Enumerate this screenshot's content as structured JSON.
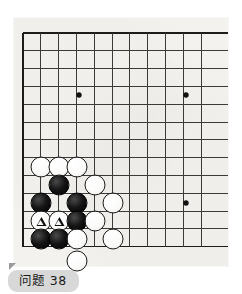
{
  "caption": {
    "label": "问题 38",
    "problem_number": "38"
  },
  "board": {
    "name": "go-board",
    "visible_columns": 11,
    "visible_rows": 13,
    "origin_x": 23,
    "origin_y": 33,
    "cell": 17.8,
    "paper_color": "#f3f2ee",
    "line_color": "#3c3a38",
    "edge_line_color": "#1e1c1a",
    "star_points": [
      {
        "x": 79,
        "y": 95
      },
      {
        "x": 186,
        "y": 95
      },
      {
        "x": 186,
        "y": 203
      }
    ],
    "stones": [
      {
        "color": "white",
        "x": 41,
        "y": 167,
        "mark": ""
      },
      {
        "color": "white",
        "x": 59,
        "y": 167,
        "mark": ""
      },
      {
        "color": "white",
        "x": 77,
        "y": 167,
        "mark": ""
      },
      {
        "color": "black",
        "x": 59,
        "y": 185,
        "mark": ""
      },
      {
        "color": "white",
        "x": 95,
        "y": 185,
        "mark": ""
      },
      {
        "color": "black",
        "x": 41,
        "y": 203,
        "mark": ""
      },
      {
        "color": "black",
        "x": 77,
        "y": 203,
        "mark": ""
      },
      {
        "color": "white",
        "x": 113,
        "y": 203,
        "mark": ""
      },
      {
        "color": "white",
        "x": 41,
        "y": 221,
        "mark": "triangle"
      },
      {
        "color": "white",
        "x": 59,
        "y": 221,
        "mark": "triangle"
      },
      {
        "color": "black",
        "x": 77,
        "y": 221,
        "mark": ""
      },
      {
        "color": "white",
        "x": 95,
        "y": 221,
        "mark": ""
      },
      {
        "color": "black",
        "x": 41,
        "y": 239,
        "mark": ""
      },
      {
        "color": "black",
        "x": 59,
        "y": 239,
        "mark": ""
      },
      {
        "color": "white",
        "x": 77,
        "y": 239,
        "mark": ""
      },
      {
        "color": "white",
        "x": 113,
        "y": 239,
        "mark": ""
      },
      {
        "color": "white",
        "x": 77,
        "y": 261,
        "mark": ""
      }
    ]
  }
}
